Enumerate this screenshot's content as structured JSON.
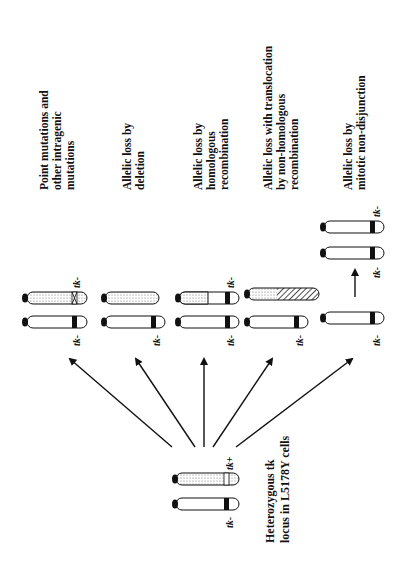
{
  "figure": {
    "orientation": "rotated-90-ccw",
    "source": {
      "title_lines": [
        "Heterozygous tk",
        "locus in L5178Y cells"
      ],
      "chromosomes": [
        {
          "allele": "tk+",
          "pattern": "dotted",
          "marker": "open-band"
        },
        {
          "allele": "tk-",
          "pattern": "plain",
          "marker": "black-band"
        }
      ]
    },
    "outcomes": [
      {
        "id": "point",
        "label_lines": [
          "Point mutations and",
          "other intragenic",
          "mutations"
        ],
        "chromosomes": [
          {
            "allele": "tk-",
            "pattern": "dotted",
            "marker": "crossed-band"
          },
          {
            "allele": "tk-",
            "pattern": "plain",
            "marker": "black-band"
          }
        ]
      },
      {
        "id": "deletion",
        "label_lines": [
          "Allelic loss by",
          "deletion"
        ],
        "chromosomes": [
          {
            "allele": "",
            "pattern": "dotted",
            "marker": "none"
          },
          {
            "allele": "tk-",
            "pattern": "plain",
            "marker": "black-band"
          }
        ]
      },
      {
        "id": "homologous",
        "label_lines": [
          "Allelic loss by",
          "homologous",
          "recombination"
        ],
        "chromosomes": [
          {
            "allele": "tk-",
            "pattern": "dotted-then-plain",
            "marker": "black-band"
          },
          {
            "allele": "tk-",
            "pattern": "plain",
            "marker": "black-band"
          }
        ]
      },
      {
        "id": "translocation",
        "label_lines": [
          "Allelic loss with translocation",
          "by non-homologous",
          "recombination"
        ],
        "chromosomes": [
          {
            "allele": "",
            "pattern": "dotted-then-hatched",
            "marker": "none"
          },
          {
            "allele": "tk-",
            "pattern": "plain",
            "marker": "black-band"
          }
        ]
      },
      {
        "id": "nondisjunction",
        "label_lines": [
          "Allelic loss by",
          "mitotic non-disjunction"
        ],
        "chromosomes": [
          {
            "allele": "tk-",
            "pattern": "plain",
            "marker": "black-band"
          },
          {
            "allele": "tk-",
            "pattern": "plain",
            "marker": "black-band"
          },
          {
            "allele": "tk-",
            "pattern": "plain",
            "marker": "black-band"
          }
        ]
      }
    ],
    "allele_labels": {
      "minus": "tk-",
      "plus": "tk+"
    }
  }
}
